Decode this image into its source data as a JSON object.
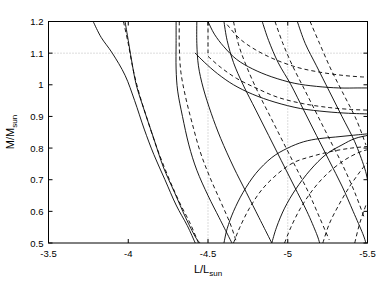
{
  "chart_data": {
    "type": "line",
    "title": "",
    "subtitle": "",
    "xlabel": "L/L_sun",
    "xlabel_main": "L/L",
    "xlabel_sub": "sun",
    "ylabel": "M/M_sun",
    "ylabel_main": "M/M",
    "ylabel_sub": "sun",
    "xlim": [
      -3.5,
      -5.5
    ],
    "ylim": [
      0.5,
      1.2
    ],
    "x_reversed": true,
    "xticks": [
      -3.5,
      -4,
      -4.5,
      -5,
      -5.5
    ],
    "xticklabels": [
      "-3.5",
      "-4",
      "-4.5",
      "-5",
      "-5.5"
    ],
    "yticks": [
      0.5,
      0.6,
      0.7,
      0.8,
      0.9,
      1,
      1.1,
      1.2
    ],
    "yticklabels": [
      "0.5",
      "0.6",
      "0.7",
      "0.8",
      "0.9",
      "1",
      "1.1",
      "1.2"
    ],
    "grid": true,
    "grid_style": "dotted",
    "grid_x_values": [
      -4.5,
      -5
    ],
    "grid_y_values": [
      1.1
    ],
    "legend": "none",
    "legend_position": "none",
    "annotations": [],
    "series_description": "Pairs of contour curves: solid lines and dashed lines representing two model families in the mass-luminosity plane.",
    "series": [
      {
        "name": "solid-1",
        "style": "solid",
        "points": [
          [
            -3.78,
            1.2
          ],
          [
            -3.83,
            1.15
          ],
          [
            -3.9,
            1.1
          ],
          [
            -3.98,
            1.03
          ],
          [
            -4.04,
            0.95
          ],
          [
            -4.1,
            0.86
          ],
          [
            -4.16,
            0.78
          ],
          [
            -4.23,
            0.7
          ],
          [
            -4.3,
            0.62
          ],
          [
            -4.37,
            0.555
          ],
          [
            -4.42,
            0.5
          ]
        ]
      },
      {
        "name": "solid-2",
        "style": "solid",
        "points": [
          [
            -3.98,
            1.2
          ],
          [
            -4.0,
            1.14
          ],
          [
            -4.02,
            1.08
          ],
          [
            -4.05,
            1.0
          ],
          [
            -4.1,
            0.92
          ],
          [
            -4.16,
            0.83
          ],
          [
            -4.22,
            0.74
          ],
          [
            -4.29,
            0.66
          ],
          [
            -4.36,
            0.58
          ],
          [
            -4.42,
            0.52
          ],
          [
            -4.45,
            0.5
          ]
        ]
      },
      {
        "name": "dashed-2",
        "style": "dashed",
        "points": [
          [
            -3.97,
            1.2
          ],
          [
            -4.0,
            1.13
          ],
          [
            -4.03,
            1.05
          ],
          [
            -4.07,
            0.97
          ],
          [
            -4.12,
            0.89
          ],
          [
            -4.18,
            0.8
          ],
          [
            -4.25,
            0.71
          ],
          [
            -4.32,
            0.63
          ],
          [
            -4.39,
            0.56
          ],
          [
            -4.44,
            0.5
          ]
        ]
      },
      {
        "name": "solid-3",
        "style": "solid",
        "points": [
          [
            -4.3,
            1.2
          ],
          [
            -4.3,
            1.13
          ],
          [
            -4.3,
            1.05
          ],
          [
            -4.31,
            0.98
          ],
          [
            -4.34,
            0.9
          ],
          [
            -4.38,
            0.81
          ],
          [
            -4.43,
            0.73
          ],
          [
            -4.5,
            0.65
          ],
          [
            -4.57,
            0.58
          ],
          [
            -4.63,
            0.52
          ],
          [
            -4.65,
            0.5
          ]
        ]
      },
      {
        "name": "dashed-3",
        "style": "dashed",
        "points": [
          [
            -4.32,
            1.2
          ],
          [
            -4.32,
            1.12
          ],
          [
            -4.33,
            1.04
          ],
          [
            -4.36,
            0.96
          ],
          [
            -4.4,
            0.88
          ],
          [
            -4.45,
            0.79
          ],
          [
            -4.51,
            0.71
          ],
          [
            -4.58,
            0.63
          ],
          [
            -4.64,
            0.56
          ],
          [
            -4.68,
            0.5
          ]
        ]
      },
      {
        "name": "solid-4",
        "style": "solid",
        "points": [
          [
            -4.43,
            1.2
          ],
          [
            -4.43,
            1.13
          ],
          [
            -4.44,
            1.06
          ],
          [
            -4.47,
            0.99
          ],
          [
            -4.52,
            0.91
          ],
          [
            -4.58,
            0.83
          ],
          [
            -4.66,
            0.74
          ],
          [
            -4.74,
            0.66
          ],
          [
            -4.82,
            0.58
          ],
          [
            -4.88,
            0.52
          ],
          [
            -4.9,
            0.5
          ]
        ]
      },
      {
        "name": "solid-5",
        "style": "solid",
        "points": [
          [
            -4.6,
            1.2
          ],
          [
            -4.62,
            1.14
          ],
          [
            -4.66,
            1.07
          ],
          [
            -4.72,
            1.0
          ],
          [
            -4.8,
            0.92
          ],
          [
            -4.88,
            0.84
          ],
          [
            -4.96,
            0.76
          ],
          [
            -5.04,
            0.68
          ],
          [
            -5.12,
            0.6
          ],
          [
            -5.18,
            0.53
          ],
          [
            -5.2,
            0.5
          ]
        ]
      },
      {
        "name": "dashed-5",
        "style": "dashed",
        "points": [
          [
            -4.66,
            1.2
          ],
          [
            -4.69,
            1.13
          ],
          [
            -4.74,
            1.06
          ],
          [
            -4.81,
            0.98
          ],
          [
            -4.89,
            0.9
          ],
          [
            -4.97,
            0.82
          ],
          [
            -5.05,
            0.74
          ],
          [
            -5.13,
            0.66
          ],
          [
            -5.2,
            0.58
          ],
          [
            -5.26,
            0.51
          ]
        ]
      },
      {
        "name": "solid-6",
        "style": "solid",
        "points": [
          [
            -4.84,
            1.2
          ],
          [
            -4.88,
            1.14
          ],
          [
            -4.94,
            1.07
          ],
          [
            -5.02,
            1.0
          ],
          [
            -5.1,
            0.92
          ],
          [
            -5.18,
            0.84
          ],
          [
            -5.26,
            0.76
          ],
          [
            -5.34,
            0.68
          ],
          [
            -5.41,
            0.6
          ],
          [
            -5.47,
            0.53
          ],
          [
            -5.49,
            0.5
          ]
        ]
      },
      {
        "name": "dashed-6",
        "style": "dashed",
        "points": [
          [
            -4.92,
            1.2
          ],
          [
            -4.97,
            1.13
          ],
          [
            -5.03,
            1.06
          ],
          [
            -5.11,
            0.98
          ],
          [
            -5.19,
            0.9
          ],
          [
            -5.27,
            0.82
          ],
          [
            -5.35,
            0.74
          ],
          [
            -5.42,
            0.66
          ],
          [
            -5.48,
            0.58
          ]
        ]
      },
      {
        "name": "solid-7",
        "style": "solid",
        "points": [
          [
            -5.06,
            1.2
          ],
          [
            -5.11,
            1.13
          ],
          [
            -5.18,
            1.06
          ],
          [
            -5.26,
            0.98
          ],
          [
            -5.34,
            0.9
          ],
          [
            -5.42,
            0.82
          ],
          [
            -5.48,
            0.74
          ],
          [
            -5.5,
            0.7
          ]
        ]
      },
      {
        "name": "dashed-7",
        "style": "dashed",
        "points": [
          [
            -5.14,
            1.2
          ],
          [
            -5.2,
            1.13
          ],
          [
            -5.27,
            1.05
          ],
          [
            -5.35,
            0.97
          ],
          [
            -5.43,
            0.89
          ],
          [
            -5.49,
            0.81
          ]
        ]
      },
      {
        "name": "dashed-vertical",
        "style": "dashed",
        "points": [
          [
            -4.5,
            1.2
          ],
          [
            -4.5,
            1.15
          ],
          [
            -4.5,
            1.1
          ]
        ]
      },
      {
        "name": "solid-low-1",
        "style": "solid",
        "points": [
          [
            -4.6,
            0.5
          ],
          [
            -4.62,
            0.545
          ],
          [
            -4.66,
            0.6
          ],
          [
            -4.72,
            0.66
          ],
          [
            -4.8,
            0.72
          ],
          [
            -4.9,
            0.77
          ],
          [
            -5.0,
            0.8
          ],
          [
            -5.1,
            0.82
          ],
          [
            -5.2,
            0.83
          ],
          [
            -5.3,
            0.835
          ],
          [
            -5.4,
            0.84
          ],
          [
            -5.5,
            0.845
          ]
        ]
      },
      {
        "name": "dashed-low-1",
        "style": "dashed",
        "points": [
          [
            -4.66,
            0.5
          ],
          [
            -4.7,
            0.55
          ],
          [
            -4.76,
            0.61
          ],
          [
            -4.84,
            0.67
          ],
          [
            -4.94,
            0.72
          ],
          [
            -5.04,
            0.755
          ],
          [
            -5.16,
            0.775
          ],
          [
            -5.28,
            0.79
          ],
          [
            -5.4,
            0.8
          ],
          [
            -5.5,
            0.805
          ]
        ]
      },
      {
        "name": "solid-low-2",
        "style": "solid",
        "points": [
          [
            -4.9,
            0.5
          ],
          [
            -4.93,
            0.55
          ],
          [
            -4.98,
            0.61
          ],
          [
            -5.05,
            0.67
          ],
          [
            -5.14,
            0.73
          ],
          [
            -5.24,
            0.78
          ],
          [
            -5.34,
            0.81
          ],
          [
            -5.42,
            0.83
          ],
          [
            -5.5,
            0.84
          ]
        ]
      },
      {
        "name": "dashed-low-2",
        "style": "dashed",
        "points": [
          [
            -4.98,
            0.5
          ],
          [
            -5.02,
            0.55
          ],
          [
            -5.08,
            0.61
          ],
          [
            -5.16,
            0.67
          ],
          [
            -5.25,
            0.72
          ],
          [
            -5.35,
            0.76
          ],
          [
            -5.44,
            0.785
          ],
          [
            -5.5,
            0.795
          ]
        ]
      },
      {
        "name": "dashed-low-3",
        "style": "dashed",
        "points": [
          [
            -5.22,
            0.5
          ],
          [
            -5.26,
            0.56
          ],
          [
            -5.32,
            0.62
          ],
          [
            -5.39,
            0.68
          ],
          [
            -5.46,
            0.73
          ],
          [
            -5.5,
            0.755
          ]
        ]
      },
      {
        "name": "dashed-low-4",
        "style": "dashed",
        "points": [
          [
            -5.42,
            0.5
          ],
          [
            -5.45,
            0.56
          ],
          [
            -5.49,
            0.62
          ]
        ]
      },
      {
        "name": "solid-mid-1",
        "style": "solid",
        "points": [
          [
            -4.5,
            1.2
          ],
          [
            -4.54,
            1.16
          ],
          [
            -4.6,
            1.12
          ],
          [
            -4.68,
            1.08
          ],
          [
            -4.78,
            1.05
          ],
          [
            -4.9,
            1.025
          ],
          [
            -5.04,
            1.005
          ],
          [
            -5.18,
            0.995
          ],
          [
            -5.32,
            0.99
          ],
          [
            -5.44,
            0.99
          ],
          [
            -5.5,
            0.99
          ]
        ]
      },
      {
        "name": "dashed-mid-1",
        "style": "dashed",
        "points": [
          [
            -4.62,
            1.19
          ],
          [
            -4.7,
            1.145
          ],
          [
            -4.8,
            1.11
          ],
          [
            -4.92,
            1.08
          ],
          [
            -5.06,
            1.055
          ],
          [
            -5.2,
            1.04
          ],
          [
            -5.34,
            1.03
          ],
          [
            -5.46,
            1.025
          ],
          [
            -5.5,
            1.025
          ]
        ]
      },
      {
        "name": "solid-mid-2",
        "style": "solid",
        "points": [
          [
            -4.42,
            1.1
          ],
          [
            -4.48,
            1.07
          ],
          [
            -4.56,
            1.035
          ],
          [
            -4.66,
            1.0
          ],
          [
            -4.78,
            0.97
          ],
          [
            -4.92,
            0.945
          ],
          [
            -5.08,
            0.925
          ],
          [
            -5.24,
            0.915
          ],
          [
            -5.38,
            0.91
          ],
          [
            -5.5,
            0.908
          ]
        ]
      },
      {
        "name": "dashed-mid-2",
        "style": "dashed",
        "points": [
          [
            -4.5,
            1.09
          ],
          [
            -4.58,
            1.055
          ],
          [
            -4.68,
            1.02
          ],
          [
            -4.8,
            0.99
          ],
          [
            -4.94,
            0.96
          ],
          [
            -5.1,
            0.94
          ],
          [
            -5.26,
            0.928
          ],
          [
            -5.4,
            0.922
          ],
          [
            -5.5,
            0.92
          ]
        ]
      }
    ]
  },
  "axes": {
    "xlabel_main": "L/L",
    "xlabel_sub": "sun",
    "ylabel_main": "M/M",
    "ylabel_sub": "sun"
  },
  "ticks": {
    "x": [
      "-3.5",
      "-4",
      "-4.5",
      "-5",
      "-5.5"
    ],
    "y": [
      "1.2",
      "1.1",
      "1",
      "0.9",
      "0.8",
      "0.7",
      "0.6",
      "0.5"
    ]
  }
}
